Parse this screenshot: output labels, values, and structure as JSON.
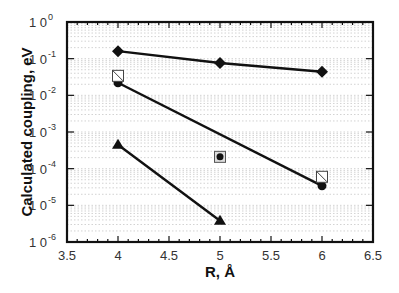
{
  "chart_data": {
    "type": "line",
    "title": "",
    "xlabel": "R,  Å",
    "ylabel": "Calculated  coupling,  eV",
    "xscale": "linear",
    "yscale": "log",
    "xlim": [
      3.5,
      6.5
    ],
    "ylim": [
      1e-06,
      1
    ],
    "x_ticks": [
      3.5,
      4,
      4.5,
      5,
      5.5,
      6,
      6.5
    ],
    "x_tick_labels": [
      "3.5",
      "4",
      "4.5",
      "5",
      "5.5",
      "6",
      "6.5"
    ],
    "y_ticks": [
      {
        "base": "1 0",
        "exp": "0",
        "value": 1
      },
      {
        "base": "1 0",
        "exp": "-1",
        "value": 0.1
      },
      {
        "base": "1 0",
        "exp": "-2",
        "value": 0.01
      },
      {
        "base": "1 0",
        "exp": "-3",
        "value": 0.001
      },
      {
        "base": "1 0",
        "exp": "-4",
        "value": 0.0001
      },
      {
        "base": "1 0",
        "exp": "-5",
        "value": 1e-05
      },
      {
        "base": "1 0",
        "exp": "-6",
        "value": 1e-06
      }
    ],
    "grid": "dotted horizontal minor log gridlines",
    "legend": null,
    "series": [
      {
        "name": "diamond series",
        "marker": "filled-diamond",
        "line": true,
        "x": [
          4,
          5,
          6
        ],
        "values": [
          0.16,
          0.076,
          0.044
        ]
      },
      {
        "name": "circle series (fit line)",
        "marker": "filled-circle",
        "line": true,
        "x": [
          4,
          6
        ],
        "values": [
          0.022,
          3.4e-05
        ]
      },
      {
        "name": "triangle series",
        "marker": "filled-triangle",
        "line": true,
        "x": [
          4,
          5
        ],
        "values": [
          0.00045,
          3.8e-06
        ]
      },
      {
        "name": "hatched square points",
        "marker": "open-square-hatched",
        "line": false,
        "x": [
          4,
          6
        ],
        "values": [
          0.034,
          6e-05
        ]
      },
      {
        "name": "circle-in-square point",
        "marker": "circle-in-square",
        "line": false,
        "x": [
          5
        ],
        "values": [
          0.00021
        ]
      }
    ]
  },
  "colors": {
    "line": "#111111",
    "grid": "#c8c8c8",
    "frame": "#111111",
    "background": "#ffffff"
  }
}
